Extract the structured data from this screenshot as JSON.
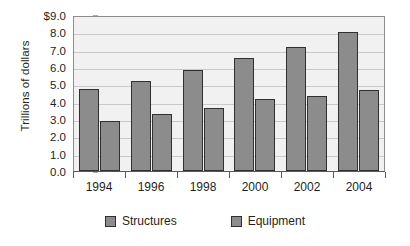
{
  "chart_data": {
    "type": "bar",
    "title": "",
    "subtitle": "",
    "xlabel": "",
    "ylabel": "Trillions of dollars",
    "categories": [
      "1994",
      "1996",
      "1998",
      "2000",
      "2002",
      "2004"
    ],
    "series": [
      {
        "name": "Structures",
        "values": [
          4.75,
          5.2,
          5.8,
          6.5,
          7.15,
          8.0
        ],
        "color": "#8c8c8c"
      },
      {
        "name": "Equipment",
        "values": [
          2.9,
          3.3,
          3.65,
          4.15,
          4.35,
          4.7
        ],
        "color": "#8c8c8c"
      }
    ],
    "ylim": [
      0.0,
      9.0
    ],
    "ytick_values": [
      9.0,
      8.0,
      7.0,
      6.0,
      5.0,
      4.0,
      3.0,
      2.0,
      1.0,
      0.0
    ],
    "ytick_labels": [
      "$9.0",
      "8.0",
      "7.0",
      "6.0",
      "5.0",
      "4.0",
      "3.0",
      "2.0",
      "1.0",
      "0.0"
    ],
    "grid": true,
    "grid_axis": "y",
    "legend_position": "bottom",
    "plot_background": "#f2f1f1",
    "gridline_color": "#c9c9c9",
    "border_color": "#8d8d8d",
    "bar_outline_color": "#303030",
    "text_color": "#231f20"
  },
  "legend": {
    "items": [
      {
        "label": "Structures",
        "swatch_name": "legend-swatch-structures"
      },
      {
        "label": "Equipment",
        "swatch_name": "legend-swatch-equipment"
      }
    ]
  }
}
